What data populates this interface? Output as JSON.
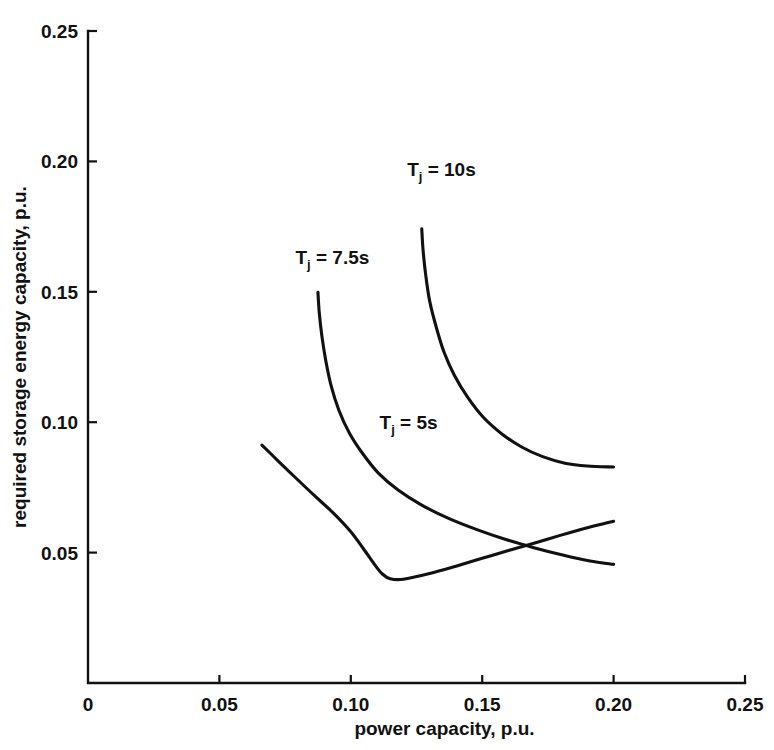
{
  "chart_data": {
    "type": "line",
    "title": "",
    "xlabel": "power capacity, p.u.",
    "ylabel": "required storage energy capacity, p.u.",
    "xlim": [
      0,
      0.25
    ],
    "ylim": [
      0,
      0.25
    ],
    "xticks": [
      0,
      0.05,
      0.1,
      0.15,
      0.2,
      0.25
    ],
    "yticks": [
      0,
      0.05,
      0.1,
      0.15,
      0.2,
      0.25
    ],
    "xticklabels": [
      "0",
      "0.05",
      "0.10",
      "0.15",
      "0.20",
      "0.25"
    ],
    "yticklabels": [
      "",
      "0.05",
      "0.10",
      "0.15",
      "0.20",
      "0.25"
    ],
    "grid": false,
    "legend": "inline-annotations",
    "line_color": "#111111",
    "background_color": "#ffffff",
    "series": [
      {
        "name": "Tj = 5s",
        "label_main": "T",
        "label_sub": "j",
        "label_rest": " = 5s",
        "label_x": 0.122,
        "label_y": 0.0975,
        "points": [
          [
            0.0662,
            0.0912
          ],
          [
            0.072,
            0.0855
          ],
          [
            0.079,
            0.0787
          ],
          [
            0.086,
            0.072
          ],
          [
            0.093,
            0.0655
          ],
          [
            0.1,
            0.058
          ],
          [
            0.105,
            0.0512
          ],
          [
            0.109,
            0.0455
          ],
          [
            0.112,
            0.0418
          ],
          [
            0.115,
            0.04
          ],
          [
            0.12,
            0.0398
          ],
          [
            0.13,
            0.042
          ],
          [
            0.14,
            0.0448
          ],
          [
            0.15,
            0.0478
          ],
          [
            0.16,
            0.0508
          ],
          [
            0.17,
            0.0537
          ],
          [
            0.18,
            0.0567
          ],
          [
            0.19,
            0.0595
          ],
          [
            0.2,
            0.062
          ]
        ]
      },
      {
        "name": "Tj = 7.5s",
        "label_main": "T",
        "label_sub": "j",
        "label_rest": " = 7.5s",
        "label_x": 0.093,
        "label_y": 0.1607,
        "points": [
          [
            0.0875,
            0.1498
          ],
          [
            0.088,
            0.142
          ],
          [
            0.089,
            0.133
          ],
          [
            0.0905,
            0.1235
          ],
          [
            0.0925,
            0.114
          ],
          [
            0.0955,
            0.1045
          ],
          [
            0.0995,
            0.0958
          ],
          [
            0.1045,
            0.088
          ],
          [
            0.1105,
            0.0805
          ],
          [
            0.118,
            0.074
          ],
          [
            0.127,
            0.0682
          ],
          [
            0.137,
            0.0632
          ],
          [
            0.148,
            0.0588
          ],
          [
            0.159,
            0.055
          ],
          [
            0.17,
            0.0518
          ],
          [
            0.181,
            0.049
          ],
          [
            0.191,
            0.0468
          ],
          [
            0.2,
            0.0455
          ]
        ]
      },
      {
        "name": "Tj = 10s",
        "label_main": "T",
        "label_sub": "j",
        "label_rest": " = 10s",
        "label_x": 0.1345,
        "label_y": 0.1945,
        "points": [
          [
            0.127,
            0.1742
          ],
          [
            0.1275,
            0.166
          ],
          [
            0.1285,
            0.1565
          ],
          [
            0.13,
            0.1465
          ],
          [
            0.1325,
            0.1365
          ],
          [
            0.1355,
            0.1268
          ],
          [
            0.1395,
            0.1178
          ],
          [
            0.1445,
            0.1095
          ],
          [
            0.1505,
            0.1018
          ],
          [
            0.1575,
            0.0955
          ],
          [
            0.165,
            0.0905
          ],
          [
            0.173,
            0.0868
          ],
          [
            0.1815,
            0.0843
          ],
          [
            0.19,
            0.0832
          ],
          [
            0.2,
            0.0828
          ]
        ]
      }
    ]
  },
  "axes": {
    "x_axis_title": "power capacity, p.u.",
    "y_axis_title": "required storage energy capacity, p.u.",
    "origin_label": "0"
  }
}
